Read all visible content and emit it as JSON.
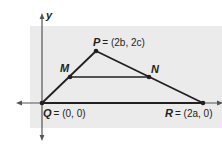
{
  "diagram": {
    "axes": {
      "y_label": "y"
    },
    "points": {
      "P": {
        "name": "P",
        "coord": "= (2b, 2c)"
      },
      "M": {
        "name": "M"
      },
      "N": {
        "name": "N"
      },
      "Q": {
        "name": "Q",
        "coord": "= (0, 0)"
      },
      "R": {
        "name": "R",
        "coord": "= (2a, 0)"
      }
    },
    "segments": [
      "QP",
      "PR",
      "QR",
      "MN"
    ],
    "colors": {
      "background_panel": "#ebebeb",
      "lines": "#231f20",
      "axes": "#555555"
    }
  }
}
